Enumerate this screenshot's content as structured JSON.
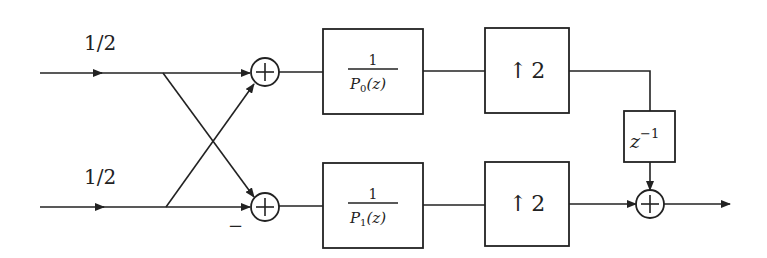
{
  "diagram": {
    "type": "signal-flow block diagram",
    "gains": [
      {
        "id": "gain-top",
        "label": "1/2"
      },
      {
        "id": "gain-bottom",
        "label": "1/2"
      }
    ],
    "adders": [
      {
        "id": "adder-top",
        "symbol": "+"
      },
      {
        "id": "adder-bottom",
        "symbol": "+",
        "negative_input_label": "−"
      },
      {
        "id": "adder-output",
        "symbol": "+"
      }
    ],
    "filters": [
      {
        "id": "filter-p0",
        "numerator": "1",
        "denominator_P": "P",
        "denominator_sub": "0",
        "denominator_arg": "(z)"
      },
      {
        "id": "filter-p1",
        "numerator": "1",
        "denominator_P": "P",
        "denominator_sub": "1",
        "denominator_arg": "(z)"
      }
    ],
    "upsamplers": [
      {
        "id": "upsampler-top",
        "arrow": "↑",
        "factor": "2"
      },
      {
        "id": "upsampler-bottom",
        "arrow": "↑",
        "factor": "2"
      }
    ],
    "delay": {
      "base": "z",
      "exponent": "−1"
    }
  }
}
